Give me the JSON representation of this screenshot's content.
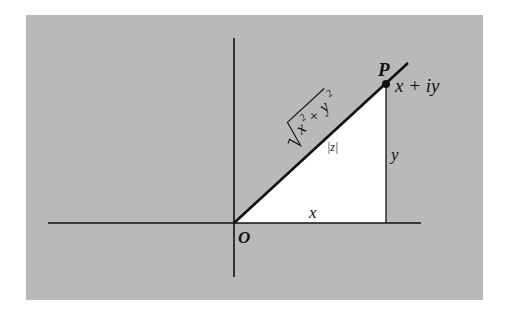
{
  "figure": {
    "colors": {
      "background": "#b9b9b9",
      "triangle": "#ffffff",
      "ink": "#111111"
    },
    "labels": {
      "origin": "O",
      "point": "P",
      "point_value": "x + iy",
      "modulus": "|z|",
      "hypotenuse_base": "x",
      "hypotenuse_plus": " + y",
      "hypotenuse_exp": "2",
      "horizontal_leg": "x",
      "vertical_leg": "y"
    }
  }
}
